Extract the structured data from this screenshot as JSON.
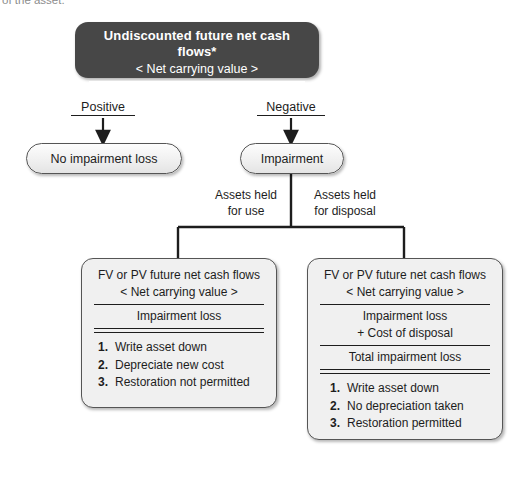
{
  "page": {
    "top_caption": "of the asset."
  },
  "header_box": {
    "name": "undiscounted-cash-flows-test",
    "line1": "Undiscounted future net cash flows*",
    "line2": "< Net carrying value >"
  },
  "branches": [
    {
      "name": "positive",
      "label": "Positive"
    },
    {
      "name": "negative",
      "label": "Negative"
    }
  ],
  "outcomes": [
    {
      "name": "no-impairment-loss",
      "label": "No impairment loss"
    },
    {
      "name": "impairment",
      "label": "Impairment"
    }
  ],
  "split_labels": [
    {
      "name": "assets-held-for-use",
      "line1": "Assets held",
      "line2": "for use"
    },
    {
      "name": "assets-held-for-disposal",
      "line1": "Assets held",
      "line2": "for disposal"
    }
  ],
  "held_for_use_box": {
    "line1": "FV or PV future net cash flows",
    "line2": "< Net carrying value >",
    "result": "Impairment loss",
    "steps": [
      {
        "num": "1.",
        "text": "Write asset down"
      },
      {
        "num": "2.",
        "text": "Depreciate new cost"
      },
      {
        "num": "3.",
        "text": "Restoration not permitted"
      }
    ]
  },
  "held_for_disposal_box": {
    "line1": "FV or PV future net cash flows",
    "line2": "< Net carrying value >",
    "sub1": "Impairment loss",
    "sub2": "+ Cost of disposal",
    "result": "Total impairment loss",
    "steps": [
      {
        "num": "1.",
        "text": "Write asset down"
      },
      {
        "num": "2.",
        "text": "No depreciation taken"
      },
      {
        "num": "3.",
        "text": "Restoration permitted"
      }
    ]
  },
  "colors": {
    "dark_box": "#474747",
    "pill_border": "#555555",
    "box_fill": "#f0f0f0",
    "text": "#1d1d1d",
    "canvas": "#ffffff"
  }
}
